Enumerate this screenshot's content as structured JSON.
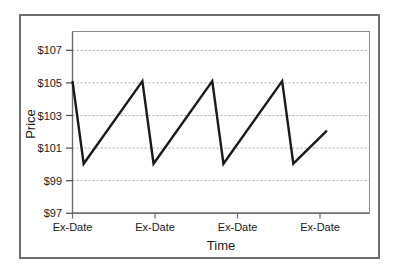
{
  "figure": {
    "background_color": "#ffffff",
    "frame_color": "#6e6e6e",
    "plot_border_color": "#888888",
    "grid_color": "#aaaaaa",
    "series_color": "#1a1a1a"
  },
  "chart_data": {
    "type": "line",
    "title": "",
    "xlabel": "Time",
    "ylabel": "Price",
    "grid": true,
    "legend": false,
    "legend_position": "none",
    "ylim": [
      97,
      108
    ],
    "yticks": [
      97,
      99,
      101,
      103,
      105,
      107
    ],
    "ytick_labels": [
      "$97",
      "$99",
      "$101",
      "$103",
      "$105",
      "$107"
    ],
    "xlim": [
      0,
      4.25
    ],
    "xticks": [
      0,
      1,
      2,
      3
    ],
    "xtick_labels": [
      "Ex-Date",
      "Ex-Date",
      "Ex-Date",
      "Ex-Date"
    ],
    "series": [
      {
        "name": "Price",
        "x": [
          0,
          0.16,
          1.0,
          1.16,
          2.0,
          2.16,
          3.0,
          3.16,
          3.64
        ],
        "y": [
          105,
          100,
          105,
          100,
          105,
          100,
          105,
          100,
          102
        ]
      }
    ]
  }
}
